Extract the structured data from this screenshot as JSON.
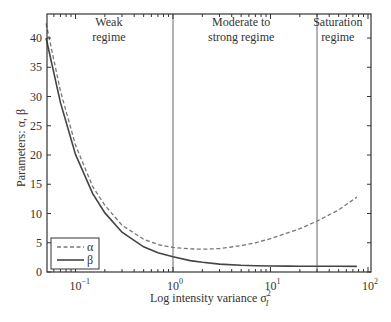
{
  "chart_data": {
    "type": "line",
    "title": "",
    "xlabel": "Log intensity variance σ_I^2",
    "xlabel_main": "Log intensity variance σ",
    "xlabel_sup": "2",
    "xlabel_sub": "I",
    "ylabel": "Parameters: α, β",
    "xscale": "log",
    "xlim": [
      0.05,
      100
    ],
    "ylim": [
      0,
      44
    ],
    "grid": false,
    "legend_position": "lower left",
    "x_ticks": [
      {
        "value": 0.1,
        "base": "10",
        "exp": "−1"
      },
      {
        "value": 1,
        "base": "10",
        "exp": "0"
      },
      {
        "value": 10,
        "base": "10",
        "exp": "1"
      },
      {
        "value": 100,
        "base": "10",
        "exp": "2"
      }
    ],
    "y_ticks": [
      0,
      5,
      10,
      15,
      20,
      25,
      30,
      35,
      40
    ],
    "regime_boundaries": [
      1,
      30
    ],
    "annotations": [
      {
        "lines": [
          "Weak",
          "regime"
        ],
        "x": 0.22
      },
      {
        "lines": [
          "Moderate to",
          "strong regime"
        ],
        "x": 5.0
      },
      {
        "lines": [
          "Saturation",
          "regime"
        ],
        "x": 49
      }
    ],
    "series": [
      {
        "name": "α",
        "style": "dashed",
        "x": [
          0.05,
          0.07,
          0.1,
          0.15,
          0.2,
          0.3,
          0.5,
          0.7,
          1,
          1.5,
          2,
          3,
          5,
          7,
          10,
          15,
          20,
          30,
          50,
          77
        ],
        "values": [
          42.5,
          31.0,
          21.7,
          14.6,
          11.4,
          8.0,
          5.6,
          4.7,
          4.2,
          3.95,
          3.9,
          4.0,
          4.5,
          5.0,
          5.7,
          6.7,
          7.4,
          8.7,
          10.6,
          12.8
        ]
      },
      {
        "name": "β",
        "style": "solid",
        "x": [
          0.05,
          0.07,
          0.1,
          0.15,
          0.2,
          0.3,
          0.5,
          0.7,
          1,
          1.5,
          2,
          3,
          5,
          7,
          10,
          15,
          20,
          30,
          50,
          77
        ],
        "values": [
          40.0,
          29.0,
          20.1,
          13.4,
          10.1,
          6.8,
          4.3,
          3.3,
          2.6,
          1.95,
          1.65,
          1.35,
          1.15,
          1.08,
          1.03,
          1.0,
          0.99,
          0.98,
          0.97,
          0.96
        ]
      }
    ]
  }
}
